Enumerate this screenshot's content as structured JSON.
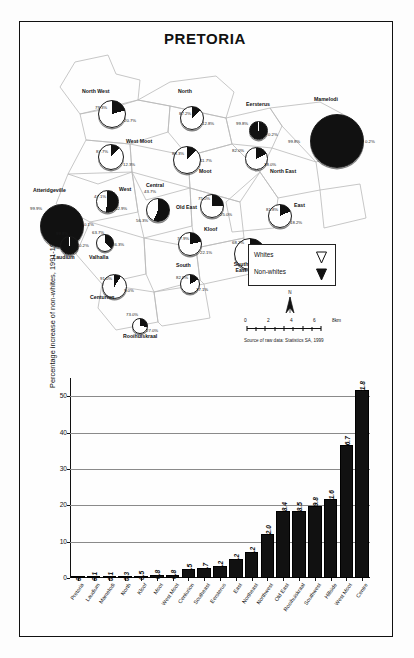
{
  "map": {
    "title": "PRETORIA",
    "legend": {
      "items": [
        {
          "label": "Whites",
          "color": "#ffffff",
          "icon": "white-wedge-icon"
        },
        {
          "label": "Non-whites",
          "color": "#111111",
          "icon": "black-wedge-icon"
        }
      ]
    },
    "north_arrow": {
      "label": "N"
    },
    "scale": {
      "ticks": [
        "0",
        "2",
        "4",
        "6",
        "8km"
      ],
      "unit": "km"
    },
    "source_note": "Source of raw data: Statistics SA, 1999",
    "regions": [
      {
        "name": "North West",
        "white": "79.3%",
        "nonwhite": "20.7%"
      },
      {
        "name": "West Moot",
        "white": "87.7%",
        "nonwhite": "12.3%"
      },
      {
        "name": "North",
        "white": "87.2%",
        "nonwhite": "12.8%"
      },
      {
        "name": "Moot",
        "white": "88.3%",
        "nonwhite": "11.7%"
      },
      {
        "name": "Eersterus",
        "white": "99.8%",
        "nonwhite": "0.2%"
      },
      {
        "name": "Mamelodi",
        "white": "99.8%",
        "nonwhite": "0.2%"
      },
      {
        "name": "North East",
        "white": "82.0%",
        "nonwhite": "18.0%"
      },
      {
        "name": "West",
        "white": "47.1%",
        "nonwhite": "52.9%"
      },
      {
        "name": "Atteridgeville",
        "white": "99.9%",
        "nonwhite": "0.1%"
      },
      {
        "name": "Laudium",
        "white": "99.8%",
        "nonwhite": "0.2%"
      },
      {
        "name": "Central",
        "white": "43.7%",
        "nonwhite": "56.3%"
      },
      {
        "name": "Old East",
        "white": "75.0%",
        "nonwhite": "25.0%"
      },
      {
        "name": "Kloof",
        "white": "77.9%",
        "nonwhite": "22.1%"
      },
      {
        "name": "East",
        "white": "81.8%",
        "nonwhite": "18.2%"
      },
      {
        "name": "Valhalla",
        "white": "63.7%",
        "nonwhite": "36.3%"
      },
      {
        "name": "South East",
        "white": "68.2%",
        "nonwhite": "31.8%"
      },
      {
        "name": "South",
        "white": "82.9%",
        "nonwhite": "17.1%"
      },
      {
        "name": "Centurion",
        "white": "91.0%",
        "nonwhite": "9.0%"
      },
      {
        "name": "Rooihuiskraal",
        "white": "73.0%",
        "nonwhite": "27.0%"
      }
    ]
  },
  "chart_data": {
    "type": "bar",
    "title": "",
    "xlabel": "",
    "ylabel": "Percentage increase of non-whites, 1991-1996",
    "ylim": [
      0,
      55
    ],
    "yticks": [
      0,
      10,
      20,
      30,
      40,
      50
    ],
    "grid": true,
    "legend": "none",
    "categories": [
      "Pretoria",
      "Laudium",
      "Mamelodi",
      "North",
      "Kloof",
      "Moot",
      "West Moot",
      "Centurion",
      "Southeast",
      "Eersterus",
      "East",
      "Northeast",
      "Northwest",
      "Old East",
      "Rooihuiskraal",
      "Southwest",
      "Hillside",
      "West Moot",
      "Centre"
    ],
    "values": [
      0,
      0.1,
      0.1,
      0.3,
      0.5,
      0.8,
      0.8,
      2.5,
      2.7,
      3.2,
      5.2,
      7.2,
      12.0,
      18.4,
      18.5,
      19.8,
      21.6,
      36.7,
      51.8
    ],
    "value_labels": [
      "0",
      "0.1",
      "0.1",
      "0.3",
      "0.5",
      "0.8",
      "0.8",
      "2.5",
      "2.7",
      "3.2",
      "5.2",
      "7.2",
      "12.0",
      "18.4",
      "18.5",
      "19.8",
      "21.6",
      "36.7",
      "51.8"
    ]
  }
}
